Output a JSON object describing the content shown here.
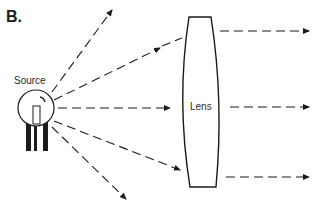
{
  "figure": {
    "panel_label": "B."
  },
  "source": {
    "label": "Source",
    "icon": "light-bulb-icon",
    "center": [
      36,
      108
    ],
    "radius": 18
  },
  "lens": {
    "label": "Lens",
    "shape": "biconvex"
  },
  "colors": {
    "stroke": "#1a1a1a",
    "background": "#ffffff"
  },
  "rays": {
    "diverging_count": 6,
    "refracted_count": 3,
    "style": "dashed-with-arrowhead"
  }
}
